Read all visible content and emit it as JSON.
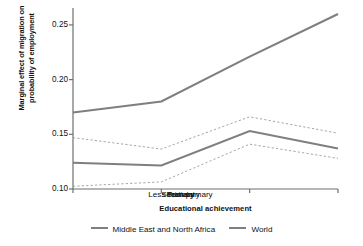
{
  "chart_data": {
    "type": "line",
    "title": "",
    "xlabel": "Educational achievement",
    "ylabel": "Marginal effect of migration on probability of employment",
    "ylabel_line1": "Marginal effect of migration on",
    "ylabel_line2": "probability of employment",
    "categories": [
      "Less than primary",
      "Primary",
      "Secondary",
      "Tertiary"
    ],
    "ylim": [
      0.1,
      0.26
    ],
    "yticks": [
      0.1,
      0.15,
      0.2,
      0.25
    ],
    "ytick_labels": [
      "0.10",
      "0.15",
      "0.20",
      "0.25"
    ],
    "grid": false,
    "legend_position": "bottom",
    "line_color": "#7f7f7f",
    "ci_color": "#9a9a9a",
    "axis_color": "#6f6f6f",
    "series": [
      {
        "name": "World",
        "style": "solid",
        "values": [
          0.17,
          0.18,
          0.221,
          0.26
        ]
      },
      {
        "name": "Middle East and North Africa",
        "style": "solid",
        "values": [
          0.124,
          0.1215,
          0.153,
          0.137
        ]
      },
      {
        "name": "Middle East and North Africa upper CI",
        "style": "dashed",
        "values": [
          0.147,
          0.1365,
          0.166,
          0.151
        ]
      },
      {
        "name": "Middle East and North Africa lower CI",
        "style": "dashed",
        "values": [
          0.1025,
          0.1065,
          0.141,
          0.128
        ]
      }
    ],
    "legend": [
      "Middle East and North Africa",
      "World"
    ]
  }
}
